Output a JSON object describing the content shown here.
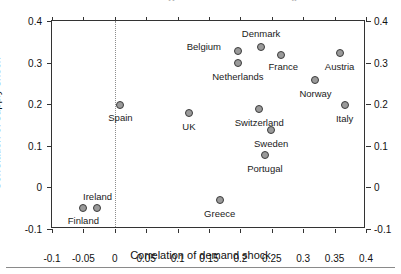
{
  "figure": {
    "title_remnants": [
      "p",
      "y"
    ],
    "bottom_rule": true
  },
  "chart_data": {
    "type": "scatter",
    "title": "",
    "xlabel": "Correlation of demand shock",
    "ylabel": "Correlation of supply shock",
    "xlim": [
      -0.1,
      0.4
    ],
    "ylim": [
      -0.1,
      0.4
    ],
    "xticks": [
      -0.1,
      -0.05,
      0,
      0.05,
      0.1,
      0.15,
      0.2,
      0.25,
      0.3,
      0.35,
      0.4
    ],
    "yticks": [
      -0.1,
      0,
      0.1,
      0.2,
      0.3,
      0.4
    ],
    "xtick_labels": [
      "-0.1",
      "-0.05",
      "0",
      "0.05",
      "0.1",
      "0.15",
      "0.2",
      "0.25",
      "0.3",
      "0.35",
      "0.4"
    ],
    "ytick_labels": [
      "-0.1",
      "0",
      "0.1",
      "0.2",
      "0.3",
      "0.4"
    ],
    "grid": false,
    "legend": "none",
    "mirrored_axes": true,
    "reference_lines": [
      {
        "name": "zero-vertical",
        "orientation": "vertical",
        "x": 0,
        "style": "dotted"
      }
    ],
    "points": [
      {
        "label": "Denmark",
        "x": 0.233,
        "y": 0.338,
        "label_dx": 0,
        "label_dy": -13
      },
      {
        "label": "Belgium",
        "x": 0.196,
        "y": 0.328,
        "label_dx": -34,
        "label_dy": -4
      },
      {
        "label": "France",
        "x": 0.265,
        "y": 0.318,
        "label_dx": 2,
        "label_dy": 12
      },
      {
        "label": "Austria",
        "x": 0.358,
        "y": 0.322,
        "label_dx": 0,
        "label_dy": 14
      },
      {
        "label": "Netherlands",
        "x": 0.196,
        "y": 0.298,
        "label_dx": 0,
        "label_dy": 14
      },
      {
        "label": "Norway",
        "x": 0.318,
        "y": 0.258,
        "label_dx": 1,
        "label_dy": 14
      },
      {
        "label": "Spain",
        "x": 0.009,
        "y": 0.199,
        "label_dx": 0,
        "label_dy": 13
      },
      {
        "label": "Italy",
        "x": 0.366,
        "y": 0.197,
        "label_dx": 0,
        "label_dy": 14
      },
      {
        "label": "Switzerland",
        "x": 0.23,
        "y": 0.188,
        "label_dx": 0,
        "label_dy": 14
      },
      {
        "label": "UK",
        "x": 0.118,
        "y": 0.178,
        "label_dx": 0,
        "label_dy": 14
      },
      {
        "label": "Sweden",
        "x": 0.249,
        "y": 0.137,
        "label_dx": 0,
        "label_dy": 14
      },
      {
        "label": "Portugal",
        "x": 0.239,
        "y": 0.079,
        "label_dx": 0,
        "label_dy": 14
      },
      {
        "label": "Greece",
        "x": 0.167,
        "y": -0.031,
        "label_dx": 0,
        "label_dy": 14
      },
      {
        "label": "Ireland",
        "x": -0.029,
        "y": -0.05,
        "label_dx": 1,
        "label_dy": -11
      },
      {
        "label": "Finland",
        "x": -0.05,
        "y": -0.05,
        "label_dx": 0,
        "label_dy": 13
      }
    ]
  },
  "colors": {
    "marker_fill": "#9a9a9a",
    "marker_edge": "#3c3c3c",
    "axis": "#333333",
    "text": "#1a1a1a",
    "background": "#ffffff",
    "zero_line": "#8d8d8d"
  }
}
